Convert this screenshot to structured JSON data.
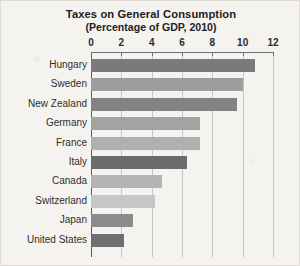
{
  "chart_data": {
    "type": "bar",
    "orientation": "horizontal",
    "title": "Taxes on General Consumption",
    "subtitle": "(Percentage of GDP, 2010)",
    "xlabel": "",
    "ylabel": "",
    "xlim": [
      0,
      12
    ],
    "xticks": [
      0,
      2,
      4,
      6,
      8,
      10,
      12
    ],
    "xtick_labels": [
      "0",
      "2",
      "4",
      "6",
      "8",
      "10",
      "12"
    ],
    "grid": true,
    "legend": false,
    "categories": [
      "Hungary",
      "Sweden",
      "New Zealand",
      "Germany",
      "France",
      "Italy",
      "Canada",
      "Switzerland",
      "Japan",
      "United States"
    ],
    "values": [
      10.8,
      10.0,
      9.6,
      7.2,
      7.2,
      6.3,
      4.7,
      4.2,
      2.8,
      2.2
    ],
    "bar_colors": [
      "#7a7a7a",
      "#9d9d9d",
      "#838383",
      "#a3a3a3",
      "#b0b0b0",
      "#6b6b6b",
      "#b4b4b4",
      "#c6c6c6",
      "#8c8c8c",
      "#6f6f6f"
    ]
  },
  "style": {
    "page_background": "#f4f3f0",
    "axis_color": "#6d6d6d",
    "grid_color": "#c9c6c0",
    "text_color": "#2b2b2b"
  }
}
